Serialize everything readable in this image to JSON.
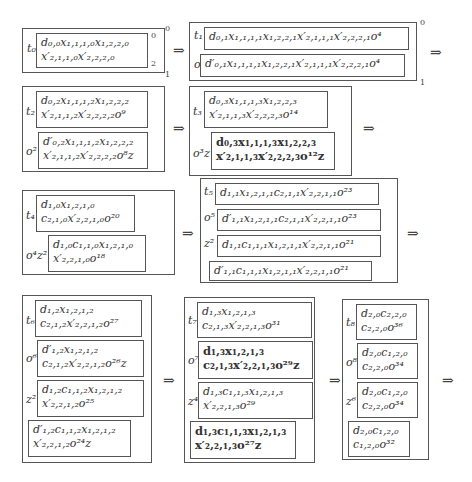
{
  "arrow": "⇒",
  "r1": {
    "b0": {
      "lab": "t₀",
      "l1": "d₀,₀x₁,₁,₁,₀x₁,₂,₂,₀",
      "l2": "x′₂,₁,₁,₀x′₂,₂,₂,₀"
    },
    "b1": {
      "t": "t₁",
      "tl": "d₀,₁x₁,₁,₁,₁x₁,₂,₂,₁x′₂,₁,₁,₁x′₂,₂,₂,₁o⁴",
      "o": "o",
      "ol": "d′₀,₁x₁,₁,₁,₁x₁,₂,₂,₁x′₂,₁,₁,₁x′₂,₂,₂,₁o⁴"
    }
  },
  "r2": {
    "b0": {
      "t": "t₂",
      "t1": "d₀,₂x₁,₁,₁,₂x₁,₂,₂,₂",
      "t2": "x′₂,₁,₁,₂x′₂,₂,₂,₂o⁹",
      "o": "o²",
      "o1": "d′₀,₂x₁,₁,₁,₂x₁,₂,₂,₂",
      "o2": "x′₂,₁,₁,₂x′₂,₂,₂,₂o⁸z"
    },
    "b1": {
      "t": "t₃",
      "t1": "d₀,₃x₁,₁,₁,₃x₁,₂,₂,₃",
      "t2": "x′₂,₁,₁,₃x′₂,₂,₂,₃o¹⁴",
      "o": "o³z",
      "o1": "d₀,₃x₁,₁,₁,₃x₁,₂,₂,₃",
      "o2": "x′₂,₁,₁,₃x′₂,₂,₂,₃o¹²z"
    }
  },
  "r3": {
    "b0": {
      "t": "t₄",
      "t1": "d₁,₀x₁,₂,₁,₀",
      "t2": "c₂,₁,₀x′₂,₂,₁,₀o²⁰",
      "o": "o⁴z²",
      "o1": "d₁,₀c₁,₁,₀x₁,₂,₁,₀",
      "o2": "x′₂,₂,₁,₀o¹⁸"
    },
    "b1": {
      "t": "t₅",
      "tl": "d₁,₁x₁,₂,₁,₁c₂,₁,₁x′₂,₂,₁,₁o²³",
      "o": "o⁵",
      "ol": "d′₁,₁x₁,₂,₁,₁c₂,₁,₁x′₂,₂,₁,₁o²³",
      "z": "z²",
      "zl": "d₁,₁c₁,₁,₁x₁,₂,₁,₁x′₂,₂,₁,₁o²¹",
      "dl": "d′₁,₁c₁,₁,₁x₁,₂,₁,₁x′₂,₂,₁,₁o²¹"
    }
  },
  "r4": {
    "b0": {
      "t": "t₆",
      "t1": "d₁,₂x₁,₂,₁,₂",
      "t2": "c₂,₁,₂x′₂,₂,₁,₂o²⁷",
      "o": "o⁶",
      "o1": "d′₁,₂x₁,₂,₁,₂",
      "o2": "c₂,₁,₂x′₂,₂,₁,₂o²⁶z",
      "z": "z²",
      "z1": "d₁,₂c₁,₁,₂x₁,₂,₁,₂",
      "z2": "x′₂,₂,₁,₂o²⁵",
      "d1": "d′₁,₂c₁,₁,₂x₁,₂,₁,₂",
      "d2": "x′₂,₂,₁,₂o²⁴z"
    },
    "b1": {
      "t": "t₇",
      "t1": "d₁,₃x₁,₂,₁,₃",
      "t2": "c₂,₁,₃x′₂,₂,₁,₃o³¹",
      "o": "o⁷",
      "o1": "d₁,₃x₁,₂,₁,₃",
      "o2": "c₂,₁,₃x′₂,₂,₁,₃o²⁹z",
      "z": "z⁴",
      "z1": "d₁,₃c₁,₁,₃x₁,₂,₁,₃",
      "z2": "x′₂,₂,₁,₃o²⁹",
      "d1": "d₁,₃c₁,₁,₃x₁,₂,₁,₃",
      "d2": "x′₂,₂,₁,₃o²⁷z"
    },
    "b2": {
      "t": "t₈",
      "t1": "d₂,₀c₂,₂,₀",
      "t2": "c₂,₂,₀o³⁶",
      "o": "o⁸",
      "o1": "d₂,₀c₁,₂,₀",
      "o2": "c₂,₂,₀o³⁴",
      "z": "z⁶",
      "z1": "d₂,₀c₁,₂,₀",
      "z2": "c₂,₂,₀o³⁴",
      "d1": "d₂,₀c₁,₂,₀",
      "d2": "c₁,₂,₀o³²"
    }
  },
  "nums": {
    "zero": "0",
    "one": "1",
    "two": "2"
  }
}
